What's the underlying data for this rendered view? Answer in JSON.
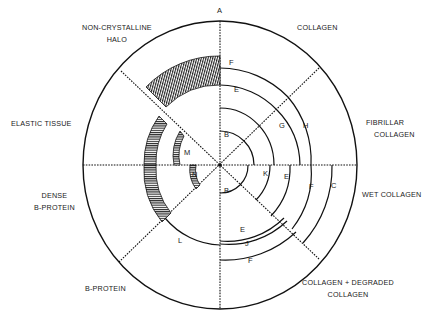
{
  "diagram": {
    "type": "polar sector diagram",
    "top_marker": "A",
    "sectors": [
      {
        "name": "COLLAGEN",
        "lines": [
          "COLLAGEN"
        ]
      },
      {
        "name": "FIBRILLAR COLLAGEN",
        "lines": [
          "FIBRILLAR",
          "COLLAGEN"
        ]
      },
      {
        "name": "WET COLLAGEN",
        "lines": [
          "WET  COLLAGEN"
        ]
      },
      {
        "name": "COLLAGEN + DEGRADED COLLAGEN",
        "lines": [
          "COLLAGEN + DEGRADED",
          "COLLAGEN"
        ]
      },
      {
        "name": "B-PROTEIN",
        "lines": [
          "B-PROTEIN"
        ]
      },
      {
        "name": "DENSE B-PROTEIN",
        "lines": [
          "DENSE",
          "B-PROTEIN"
        ]
      },
      {
        "name": "ELASTIC TISSUE",
        "lines": [
          "ELASTIC  TISSUE"
        ]
      },
      {
        "name": "NON-CRYSTALLINE HALO",
        "lines": [
          "NON-CRYSTALLINE",
          "HALO"
        ]
      }
    ],
    "arc_labels": {
      "collagen": [
        "F",
        "E"
      ],
      "fibrillar": [
        "B",
        "G",
        "H"
      ],
      "wet": [
        "K",
        "E",
        "F",
        "C"
      ],
      "degraded": [
        "B",
        "E",
        "J",
        "F"
      ],
      "bprotein": [
        "L"
      ],
      "dense": [
        "N",
        "D"
      ],
      "elastic": [
        "M",
        "D"
      ],
      "halo": [
        "D"
      ]
    }
  }
}
